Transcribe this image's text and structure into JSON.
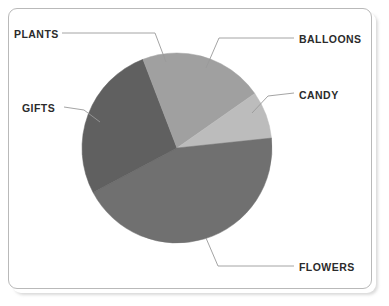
{
  "figure": {
    "background": "#ffffff",
    "frame_color": "#b9b9b9",
    "label_color": "#2b2b2b",
    "leader_color": "#9a9a9a"
  },
  "labels": {
    "plants": "PLANTS",
    "balloons": "BALLOONS",
    "candy": "CANDY",
    "gifts": "GIFTS",
    "flowers": "FLOWERS"
  },
  "chart_data": {
    "type": "pie",
    "title": "",
    "subtitle": "",
    "xlabel": "",
    "ylabel": "",
    "grid": false,
    "legend": "none",
    "labels_placement": "outside-with-leader-lines",
    "start_angle_deg": 0,
    "direction": "clockwise",
    "center_px": [
      177,
      148
    ],
    "radius_px": 95,
    "categories": [
      "BALLOONS",
      "CANDY",
      "FLOWERS",
      "GIFTS",
      "PLANTS"
    ],
    "values": [
      15.3,
      8.0,
      44.0,
      26.9,
      5.8
    ],
    "units": "percent",
    "slices": [
      {
        "label": "BALLOONS",
        "value": 15.3,
        "start_deg": 0,
        "end_deg": 55,
        "color": "#a0a0a0",
        "label_side": "right-top"
      },
      {
        "label": "CANDY",
        "value": 8.0,
        "start_deg": 55,
        "end_deg": 84,
        "color": "#bcbcbc",
        "label_side": "right"
      },
      {
        "label": "FLOWERS",
        "value": 44.0,
        "start_deg": 84,
        "end_deg": 242,
        "color": "#707070",
        "label_side": "right-bottom"
      },
      {
        "label": "GIFTS",
        "value": 26.9,
        "start_deg": 242,
        "end_deg": 339,
        "color": "#606060",
        "label_side": "left"
      },
      {
        "label": "PLANTS",
        "value": 5.8,
        "start_deg": 339,
        "end_deg": 360,
        "color": "#a0a0a0",
        "label_side": "left-top"
      }
    ]
  }
}
